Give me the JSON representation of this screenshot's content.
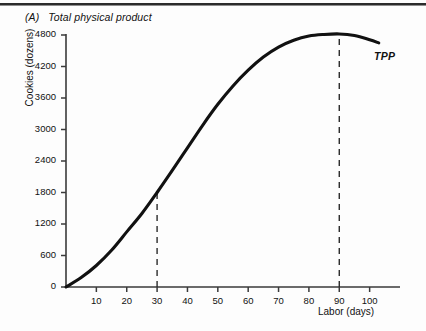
{
  "figure": {
    "panel_tag": "(A)",
    "panel_title": "Total physical product",
    "curve_label": "TPP"
  },
  "chart_data": {
    "type": "line",
    "xlabel": "Labor (days)",
    "ylabel": "Cookies (dozens)",
    "xlim": [
      0,
      110
    ],
    "ylim": [
      0,
      4800
    ],
    "grid": false,
    "legend_position": "inline-right-of-curve-end",
    "xticks": [
      10,
      20,
      30,
      40,
      50,
      60,
      70,
      80,
      90,
      100
    ],
    "yticks": [
      0,
      600,
      1200,
      1800,
      2400,
      3000,
      3600,
      4200,
      4800
    ],
    "series": [
      {
        "name": "TPP",
        "color": "#111111",
        "x": [
          0,
          5,
          10,
          15,
          20,
          25,
          30,
          35,
          40,
          45,
          50,
          55,
          60,
          65,
          70,
          75,
          80,
          85,
          90,
          95,
          100,
          103
        ],
        "values": [
          0,
          180,
          410,
          700,
          1050,
          1400,
          1800,
          2220,
          2650,
          3080,
          3480,
          3830,
          4130,
          4380,
          4570,
          4700,
          4780,
          4810,
          4820,
          4790,
          4710,
          4650
        ]
      }
    ],
    "annotations": [
      {
        "type": "dashed-vline",
        "x": 30,
        "y_from": 0,
        "y_to": 1800,
        "note": "inflection point of TPP"
      },
      {
        "type": "dashed-vline",
        "x": 90,
        "y_from": 0,
        "y_to": 4820,
        "note": "maximum of TPP"
      }
    ]
  },
  "yticks": [
    {
      "label": "4800",
      "value": 4800
    },
    {
      "label": "4200",
      "value": 4200
    },
    {
      "label": "3600",
      "value": 3600
    },
    {
      "label": "3000",
      "value": 3000
    },
    {
      "label": "2400",
      "value": 2400
    },
    {
      "label": "1800",
      "value": 1800
    },
    {
      "label": "1200",
      "value": 1200
    },
    {
      "label": "600",
      "value": 600
    },
    {
      "label": "0",
      "value": 0
    }
  ],
  "xticks": [
    {
      "label": "10",
      "value": 10
    },
    {
      "label": "20",
      "value": 20
    },
    {
      "label": "30",
      "value": 30
    },
    {
      "label": "40",
      "value": 40
    },
    {
      "label": "50",
      "value": 50
    },
    {
      "label": "60",
      "value": 60
    },
    {
      "label": "70",
      "value": 70
    },
    {
      "label": "80",
      "value": 80
    },
    {
      "label": "90",
      "value": 90
    },
    {
      "label": "100",
      "value": 100
    }
  ]
}
